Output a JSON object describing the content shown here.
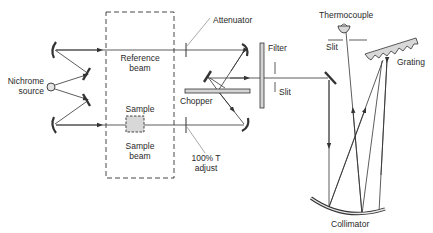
{
  "diagram": {
    "colors": {
      "line": "#333333",
      "fill": "#cfcfcf",
      "background": "#ffffff"
    },
    "labels": {
      "source": "Nichrome\nsource",
      "source_line1": "Nichrome",
      "source_line2": "source",
      "reference_beam_line1": "Reference",
      "reference_beam_line2": "beam",
      "sample": "Sample",
      "sample_beam_line1": "Sample",
      "sample_beam_line2": "beam",
      "attenuator": "Attenuator",
      "chopper": "Chopper",
      "transmittance_adjust_line1": "100% T",
      "transmittance_adjust_line2": "adjust",
      "filter": "Filter",
      "entrance_slit": "Slit",
      "thermocouple": "Thermocouple",
      "exit_slit": "Slit",
      "grating": "Grating",
      "collimator": "Collimator"
    },
    "components": [
      "Nichrome source",
      "Reference beam",
      "Sample beam",
      "Sample",
      "Attenuator",
      "100% T adjust",
      "Chopper",
      "Filter",
      "Slit",
      "Collimator",
      "Grating",
      "Slit",
      "Thermocouple"
    ]
  }
}
